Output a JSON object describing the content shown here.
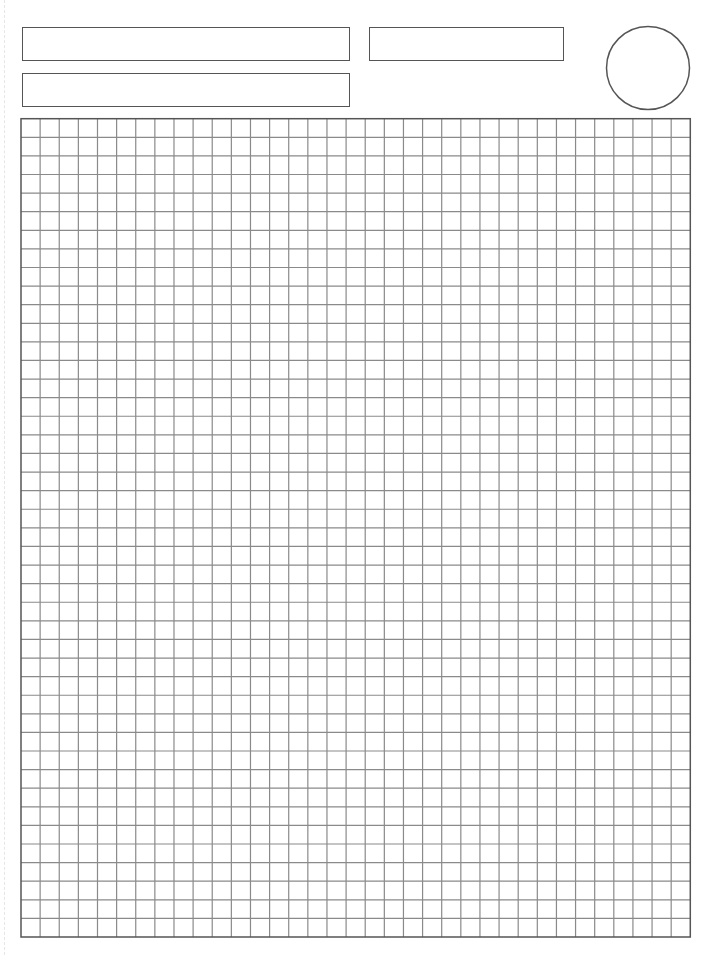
{
  "page": {
    "width": 713,
    "height": 955,
    "background": "#ffffff",
    "type": "blank graph paper form"
  },
  "header": {
    "fields": [
      {
        "id": "field-1",
        "label": "",
        "value": "",
        "x": 22,
        "y": 27,
        "width": 328,
        "height": 34
      },
      {
        "id": "field-2",
        "label": "",
        "value": "",
        "x": 22,
        "y": 73,
        "width": 328,
        "height": 34
      },
      {
        "id": "field-3",
        "label": "",
        "value": "",
        "x": 369,
        "y": 27,
        "width": 195,
        "height": 34
      }
    ],
    "circle": {
      "cx": 648,
      "cy": 68,
      "r": 41.5,
      "stroke": "#555555"
    }
  },
  "grid": {
    "x": 21,
    "y": 118.7,
    "width": 669.3,
    "height": 818.3,
    "columns": 35,
    "rows": 44,
    "line_color": "#8a8a8a",
    "border_color": "#555555"
  }
}
